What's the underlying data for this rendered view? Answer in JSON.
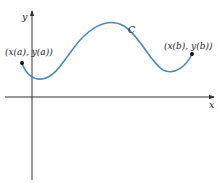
{
  "diagram": {
    "axes": {
      "x_label": "x",
      "y_label": "y",
      "color": "#333333"
    },
    "curve": {
      "label": "C",
      "color": "#4a8ac4"
    },
    "points": {
      "start_label": "(x(a), y(a))",
      "end_label": "(x(b), y(b))",
      "color": "#111111"
    }
  }
}
